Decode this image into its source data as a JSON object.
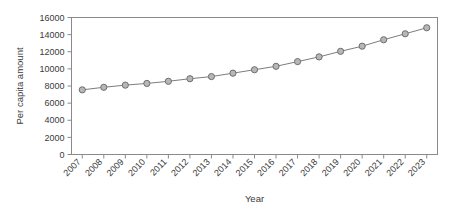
{
  "chart_data": {
    "type": "line",
    "title": "",
    "xlabel": "Year",
    "ylabel": "Per capita amount",
    "categories": [
      "2007",
      "2008",
      "2009",
      "2010",
      "2011",
      "2012",
      "2013",
      "2014",
      "2015",
      "2016",
      "2017",
      "2018",
      "2019",
      "2020",
      "2021",
      "2022",
      "2023"
    ],
    "x": [
      2007,
      2008,
      2009,
      2010,
      2011,
      2012,
      2013,
      2014,
      2015,
      2016,
      2017,
      2018,
      2019,
      2020,
      2021,
      2022,
      2023
    ],
    "values": [
      7550,
      7850,
      8100,
      8300,
      8550,
      8850,
      9100,
      9500,
      9900,
      10300,
      10850,
      11400,
      12050,
      12650,
      13400,
      14100,
      14800
    ],
    "series": [
      {
        "name": "Per capita amount",
        "values": [
          7550,
          7850,
          8100,
          8300,
          8550,
          8850,
          9100,
          9500,
          9900,
          10300,
          10850,
          11400,
          12050,
          12650,
          13400,
          14100,
          14800
        ]
      }
    ],
    "ylim": [
      0,
      16000
    ],
    "yticks": [
      0,
      2000,
      4000,
      6000,
      8000,
      10000,
      12000,
      14000,
      16000
    ],
    "ytick_labels": [
      "0",
      "2000",
      "4000",
      "6000",
      "8000",
      "10000",
      "12000",
      "14000",
      "16000"
    ],
    "xtick_labels": [
      "2007",
      "2008",
      "2009",
      "2010",
      "2011",
      "2012",
      "2013",
      "2014",
      "2015",
      "2016",
      "2017",
      "2018",
      "2019",
      "2020",
      "2021",
      "2022",
      "2023"
    ],
    "xtick_rotation": 45,
    "grid": false,
    "legend": "none",
    "marker": "circle",
    "marker_fill_color": "#b7b7b7",
    "marker_edge_color": "#6e6e6e",
    "line_color": "#7d7d7d",
    "frame_color": "#8a8a8a",
    "background_color": "#ffffff",
    "text_color": "#3b3b3b"
  }
}
